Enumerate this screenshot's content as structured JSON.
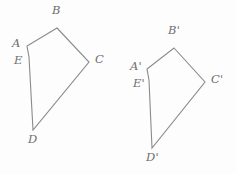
{
  "figure": {
    "stroke_color": "#8a8a8a",
    "label_color": "#6e6e6e",
    "background_color": "#fdfdfd"
  },
  "shapes": [
    {
      "name": "pentagon-abcde",
      "points": "57,28 89,62 33,130 29,57 27,46",
      "vertices": [
        {
          "id": "A",
          "label": "A",
          "x": 27,
          "y": 46,
          "label_x": 12,
          "label_y": 38
        },
        {
          "id": "B",
          "label": "B",
          "x": 57,
          "y": 28,
          "label_x": 52,
          "label_y": 5
        },
        {
          "id": "C",
          "label": "C",
          "x": 89,
          "y": 62,
          "label_x": 95,
          "label_y": 54
        },
        {
          "id": "D",
          "label": "D",
          "x": 33,
          "y": 130,
          "label_x": 28,
          "label_y": 134
        },
        {
          "id": "E",
          "label": "E",
          "x": 29,
          "y": 57,
          "label_x": 14,
          "label_y": 55
        }
      ]
    },
    {
      "name": "pentagon-abcde-prime",
      "points": "174,48 205,82 152,148 149,80 147,69",
      "vertices": [
        {
          "id": "Aprime",
          "label": "A'",
          "x": 147,
          "y": 69,
          "label_x": 130,
          "label_y": 61
        },
        {
          "id": "Bprime",
          "label": "B'",
          "x": 174,
          "y": 48,
          "label_x": 168,
          "label_y": 25
        },
        {
          "id": "Cprime",
          "label": "C'",
          "x": 205,
          "y": 82,
          "label_x": 211,
          "label_y": 74
        },
        {
          "id": "Dprime",
          "label": "D'",
          "x": 152,
          "y": 148,
          "label_x": 146,
          "label_y": 152
        },
        {
          "id": "Eprime",
          "label": "E'",
          "x": 149,
          "y": 80,
          "label_x": 133,
          "label_y": 78
        }
      ]
    }
  ]
}
